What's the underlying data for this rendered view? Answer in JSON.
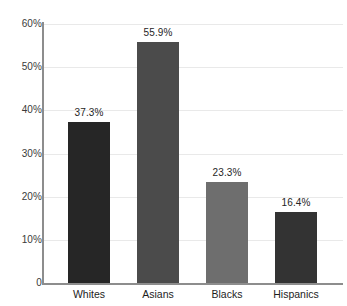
{
  "chart_data": {
    "type": "bar",
    "title": "",
    "subtitle": "",
    "xlabel": "",
    "ylabel": "",
    "categories": [
      "Whites",
      "Asians",
      "Blacks",
      "Hispanics"
    ],
    "values": [
      37.3,
      55.9,
      23.3,
      16.4
    ],
    "value_labels": [
      "37.3%",
      "55.9%",
      "23.3%",
      "16.4%"
    ],
    "bar_colors": [
      "#262626",
      "#4b4b4b",
      "#6e6e6e",
      "#333333"
    ],
    "ylim": [
      0,
      60
    ],
    "ytick_values": [
      0,
      10,
      20,
      30,
      40,
      50,
      60
    ],
    "ytick_labels": [
      "0",
      "10%",
      "20%",
      "30%",
      "40%",
      "50%",
      "60%"
    ],
    "grid": true,
    "grid_axis": "y",
    "legend": false,
    "legend_position": "none",
    "background_color": "#ffffff",
    "axis_color": "#8d8d8d",
    "gridline_color": "#e9e9e9",
    "text_color": "#252525"
  }
}
